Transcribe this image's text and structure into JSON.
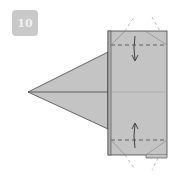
{
  "step": {
    "number": "10"
  },
  "colors": {
    "paper": "#c4c4c4",
    "paper_edge": "#b0b0b0",
    "line": "#444444",
    "badge_bg": "#c9c9c9",
    "badge_text": "#f2f2f2"
  },
  "diagram": {
    "folds": [
      {
        "position": "top",
        "direction": "down"
      },
      {
        "position": "bottom",
        "direction": "up"
      }
    ]
  }
}
